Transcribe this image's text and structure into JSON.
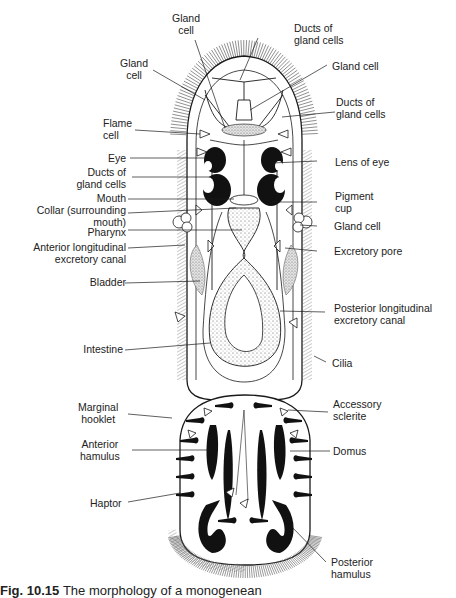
{
  "figure": {
    "caption_number": "Fig. 10.15",
    "caption_text": "The morphology of a monogenean"
  },
  "labels": {
    "left": [
      {
        "id": "gland-cell-top",
        "text": "Gland\ncell"
      },
      {
        "id": "gland-cell-left",
        "text": "Gland\ncell"
      },
      {
        "id": "flame-cell",
        "text": "Flame\ncell"
      },
      {
        "id": "eye",
        "text": "Eye"
      },
      {
        "id": "ducts-of-gland-cells-left",
        "text": "Ducts of\ngland cells"
      },
      {
        "id": "mouth",
        "text": "Mouth"
      },
      {
        "id": "collar",
        "text": "Collar (surrounding\nmouth)"
      },
      {
        "id": "pharynx",
        "text": "Pharynx"
      },
      {
        "id": "anterior-longitudinal-excretory-canal",
        "text": "Anterior longitudinal\nexcretory canal"
      },
      {
        "id": "bladder",
        "text": "Bladder"
      },
      {
        "id": "intestine",
        "text": "Intestine"
      },
      {
        "id": "marginal-hooklet",
        "text": "Marginal\nhooklet"
      },
      {
        "id": "anterior-hamulus",
        "text": "Anterior\nhamulus"
      },
      {
        "id": "haptor",
        "text": "Haptor"
      }
    ],
    "right": [
      {
        "id": "ducts-of-gland-cells-top",
        "text": "Ducts of\ngland cells"
      },
      {
        "id": "gland-cell-right-top",
        "text": "Gland cell"
      },
      {
        "id": "ducts-of-gland-cells-right",
        "text": "Ducts of\ngland cells"
      },
      {
        "id": "lens-of-eye",
        "text": "Lens of eye"
      },
      {
        "id": "pigment-cup",
        "text": "Pigment\ncup"
      },
      {
        "id": "gland-cell-right",
        "text": "Gland cell"
      },
      {
        "id": "excretory-pore",
        "text": "Excretory pore"
      },
      {
        "id": "posterior-longitudinal-excretory-canal",
        "text": "Posterior longitudinal\nexcretory canal"
      },
      {
        "id": "cilia",
        "text": "Cilia"
      },
      {
        "id": "accessory-sclerite",
        "text": "Accessory\nsclerite"
      },
      {
        "id": "domus",
        "text": "Domus"
      },
      {
        "id": "posterior-hamulus",
        "text": "Posterior\nhamulus"
      }
    ]
  },
  "colors": {
    "ink": "#1a1a1a",
    "stipple": "#b8b8b8",
    "background": "#ffffff"
  }
}
